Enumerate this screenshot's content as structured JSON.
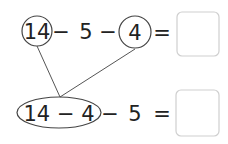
{
  "row1": {
    "circled_a": "14",
    "op1": "−",
    "num": "5",
    "op2": "−",
    "circled_b": "4",
    "eq": "=",
    "answer": ""
  },
  "row2": {
    "grouped": "14 − 4",
    "op": "−",
    "num": "5",
    "eq": "=",
    "answer": ""
  },
  "colors": {
    "stroke": "#444444",
    "text": "#222222",
    "box_border": "#cccccc"
  }
}
